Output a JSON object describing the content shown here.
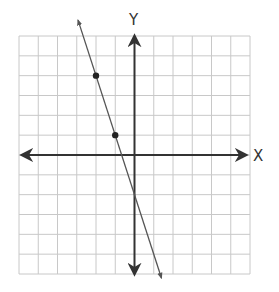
{
  "graph": {
    "x_axis_label": "X",
    "y_axis_label": "Y",
    "grid": {
      "x_min": -6,
      "x_max": 6,
      "y_min": -6,
      "y_max": 6,
      "step": 1
    },
    "line": {
      "slope": -3,
      "y_intercept": -2,
      "equation": "y = -3x - 2"
    },
    "points": [
      {
        "x": -2,
        "y": 4
      },
      {
        "x": -1,
        "y": 1
      }
    ],
    "colors": {
      "grid": "#c8c8c8",
      "axis": "#333333",
      "line": "#555555",
      "point": "#222222"
    }
  }
}
